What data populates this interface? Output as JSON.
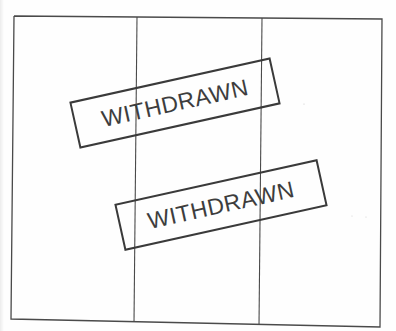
{
  "document": {
    "type": "scanned-page",
    "table": {
      "columns": 3,
      "rows": 1,
      "cells": [
        [
          "",
          "",
          ""
        ]
      ]
    },
    "stamps": [
      {
        "label": "WITHDRAWN",
        "rotation_deg": -12.5
      },
      {
        "label": "WITHDRAWN",
        "rotation_deg": -12.5
      }
    ],
    "colors": {
      "ink": "#3a3a3a",
      "rule": "#4a4a4a",
      "paper": "#fefefe"
    }
  }
}
